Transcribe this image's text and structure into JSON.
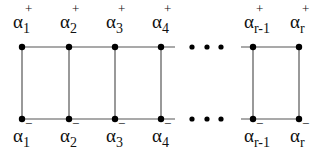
{
  "diagram": {
    "type": "ladder-graph",
    "top_row": {
      "y": 47,
      "sign": "+",
      "nodes": [
        {
          "id": "a1p",
          "x": 22,
          "base": "α",
          "sub": "1",
          "sup": "+"
        },
        {
          "id": "a2p",
          "x": 69,
          "base": "α",
          "sub": "2",
          "sup": "+"
        },
        {
          "id": "a3p",
          "x": 115,
          "base": "α",
          "sub": "3",
          "sup": "+"
        },
        {
          "id": "a4p",
          "x": 161,
          "base": "α",
          "sub": "4",
          "sup": "+"
        },
        {
          "id": "arm1p",
          "x": 253,
          "base": "α",
          "sub": "r-1",
          "sup": "+"
        },
        {
          "id": "arp",
          "x": 299,
          "base": "α",
          "sub": "r",
          "sup": "+"
        }
      ]
    },
    "bottom_row": {
      "y": 119,
      "sign": "−",
      "nodes": [
        {
          "id": "a1m",
          "x": 22,
          "base": "α",
          "sub": "1",
          "sup": "−"
        },
        {
          "id": "a2m",
          "x": 69,
          "base": "α",
          "sub": "2",
          "sup": "−"
        },
        {
          "id": "a3m",
          "x": 115,
          "base": "α",
          "sub": "3",
          "sup": "−"
        },
        {
          "id": "a4m",
          "x": 161,
          "base": "α",
          "sub": "4",
          "sup": "−"
        },
        {
          "id": "arm1m",
          "x": 253,
          "base": "α",
          "sub": "r-1",
          "sup": "−"
        },
        {
          "id": "arm",
          "x": 299,
          "base": "α",
          "sub": "r",
          "sup": "−"
        }
      ]
    },
    "ellipsis": {
      "symbol": "• • •",
      "dots_x": [
        192,
        207,
        221
      ]
    },
    "colors": {
      "edge": "#555555",
      "node": "#000000",
      "text": "#111111"
    }
  }
}
